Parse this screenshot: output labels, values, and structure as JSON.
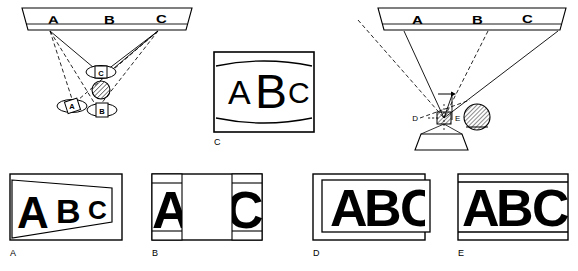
{
  "figure": {
    "stroke_color": "#000000",
    "fill_color": "#ffffff",
    "background": "#ffffff"
  },
  "diagrams": {
    "left": {
      "name": "multi-viewer-ray-diagram",
      "screen_letters": [
        "A",
        "B",
        "C"
      ],
      "viewer_markers": [
        {
          "label": "C",
          "role": "on-axis-upper-viewer"
        },
        {
          "label": "A",
          "role": "left-off-axis-viewer"
        },
        {
          "label": "B",
          "role": "center-lower-viewer"
        }
      ],
      "lens_element": "hatched-circle-lens",
      "solid_rays": 3,
      "dashed_rays": 4
    },
    "right": {
      "name": "projector-ray-diagram",
      "screen_letters": [
        "A",
        "B",
        "C"
      ],
      "point_labels": {
        "left": "D",
        "right": "E"
      },
      "lens_element": "hatched-circle-lens",
      "base_element": "trapezoid-projector-body",
      "aperture_element": "hatched-aperture-box",
      "offset_arrow": "right-pointing-arrow",
      "solid_rays": 3,
      "dashed_rays": 3
    }
  },
  "panels": [
    {
      "id": "A",
      "label": "A",
      "name": "panel-keystone-distortion",
      "letters": [
        "A",
        "B",
        "C"
      ],
      "letter_sizes": [
        44,
        34,
        26
      ],
      "distortion": "keystone-trapezoid",
      "frame": "rectangle-with-inner-trapezoid"
    },
    {
      "id": "B",
      "label": "B",
      "name": "panel-edge-bands-only",
      "letters": [
        "A",
        "C"
      ],
      "letter_sizes": [
        52,
        52
      ],
      "distortion": "center-cut-out",
      "frame": "rectangle-with-left-right-bands"
    },
    {
      "id": "C",
      "label": "C",
      "name": "panel-barrel-distortion",
      "letters": [
        "A",
        "B",
        "C"
      ],
      "letter_sizes": [
        34,
        48,
        30
      ],
      "distortion": "barrel-curved-field",
      "frame": "rectangle-with-top-bottom-arcs"
    },
    {
      "id": "D",
      "label": "D",
      "name": "panel-offset-clipped",
      "letters": [
        "A",
        "B",
        "C"
      ],
      "letter_sizes": [
        52,
        52,
        52
      ],
      "distortion": "offset-frame-right-clip",
      "frame": "rectangle-with-offset-inner-rectangle"
    },
    {
      "id": "E",
      "label": "E",
      "name": "panel-correct-image",
      "letters": [
        "A",
        "B",
        "C"
      ],
      "letter_sizes": [
        52,
        52,
        52
      ],
      "distortion": "none-correct",
      "frame": "rectangle-with-top-bottom-bands"
    }
  ]
}
